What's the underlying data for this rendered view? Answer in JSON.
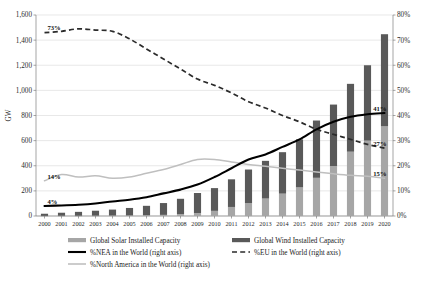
{
  "chart_data": {
    "type": "bar",
    "title": "",
    "subtitle": "",
    "xlabel": "",
    "ylabel": "GW",
    "y2label": "",
    "ylim": [
      0,
      1600
    ],
    "y2lim": [
      0,
      0.8
    ],
    "grid": true,
    "stacked": true,
    "legend_position": "bottom",
    "categories": [
      "2000",
      "2001",
      "2002",
      "2003",
      "2004",
      "2005",
      "2006",
      "2007",
      "2008",
      "2009",
      "2010",
      "2011",
      "2012",
      "2013",
      "2014",
      "2015",
      "2016",
      "2017",
      "2018",
      "2019",
      "2020"
    ],
    "y_ticks": [
      "0",
      "200",
      "400",
      "600",
      "800",
      "1,000",
      "1,200",
      "1,400",
      "1,600"
    ],
    "y2_ticks": [
      "0%",
      "10%",
      "20%",
      "30%",
      "40%",
      "50%",
      "60%",
      "70%",
      "80%"
    ],
    "series": [
      {
        "name": "Global Solar Installed Capacity",
        "type": "bar",
        "axis": "left",
        "color": "#a6a6a6",
        "values": [
          1,
          2,
          2,
          3,
          4,
          5,
          7,
          9,
          16,
          24,
          41,
          72,
          103,
          139,
          178,
          228,
          304,
          398,
          512,
          600,
          714
        ]
      },
      {
        "name": "Global Wind Installed Capacity",
        "type": "bar",
        "axis": "left",
        "color": "#595959",
        "values": [
          17,
          24,
          31,
          39,
          47,
          59,
          74,
          94,
          121,
          159,
          181,
          220,
          267,
          300,
          330,
          382,
          456,
          489,
          540,
          600,
          733
        ]
      },
      {
        "name": "%NEA in the World (right axis)",
        "type": "line",
        "axis": "right",
        "style": "solid",
        "color": "#000000",
        "values": [
          0.04,
          0.042,
          0.045,
          0.05,
          0.058,
          0.065,
          0.075,
          0.09,
          0.105,
          0.125,
          0.155,
          0.19,
          0.225,
          0.245,
          0.275,
          0.305,
          0.345,
          0.375,
          0.395,
          0.405,
          0.41
        ]
      },
      {
        "name": "%EU in the World (right axis)",
        "type": "line",
        "axis": "right",
        "style": "dashed",
        "color": "#2b2b2b",
        "values": [
          0.73,
          0.735,
          0.745,
          0.74,
          0.735,
          0.705,
          0.665,
          0.625,
          0.585,
          0.545,
          0.52,
          0.49,
          0.455,
          0.43,
          0.4,
          0.375,
          0.345,
          0.325,
          0.305,
          0.285,
          0.27
        ]
      },
      {
        "name": "%North America in the World (right axis)",
        "type": "line",
        "axis": "right",
        "style": "solid-light",
        "color": "#bfbfbf",
        "values": [
          0.14,
          0.165,
          0.155,
          0.16,
          0.15,
          0.155,
          0.17,
          0.185,
          0.205,
          0.225,
          0.225,
          0.215,
          0.205,
          0.198,
          0.19,
          0.183,
          0.175,
          0.168,
          0.162,
          0.158,
          0.15
        ]
      }
    ],
    "annotations": [
      {
        "text": "73%",
        "series": "%EU in the World (right axis)",
        "x": "2000",
        "value": 0.73
      },
      {
        "text": "14%",
        "series": "%North America in the World (right axis)",
        "x": "2000",
        "value": 0.14
      },
      {
        "text": "4%",
        "series": "%NEA in the World (right axis)",
        "x": "2000",
        "value": 0.04
      },
      {
        "text": "41%",
        "series": "%NEA in the World (right axis)",
        "x": "2020",
        "value": 0.41
      },
      {
        "text": "27%",
        "series": "%EU in the World (right axis)",
        "x": "2020",
        "value": 0.27
      },
      {
        "text": "15%",
        "series": "%North America in the World (right axis)",
        "x": "2020",
        "value": 0.15
      }
    ]
  },
  "legend": {
    "items": [
      {
        "label": "Global Solar Installed Capacity",
        "marker": "bar-swatch-light"
      },
      {
        "label": "Global Wind Installed Capacity",
        "marker": "bar-swatch-dark"
      },
      {
        "label": "%NEA in the World (right axis)",
        "marker": "line-solid-black"
      },
      {
        "label": "%EU in the World (right axis)",
        "marker": "line-dashed-black"
      },
      {
        "label": "%North America in the World (right axis)",
        "marker": "line-solid-light"
      }
    ]
  },
  "colors": {
    "solar": "#a6a6a6",
    "wind": "#595959",
    "nea": "#000000",
    "eu": "#2b2b2b",
    "north_america": "#bfbfbf",
    "grid": "#d9d9d9",
    "axis": "#808080",
    "background": "#ffffff"
  }
}
